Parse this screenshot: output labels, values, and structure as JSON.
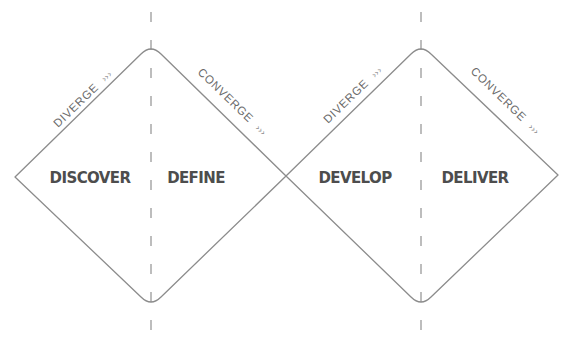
{
  "diagram": {
    "colors": {
      "outline": "#8c8c8c",
      "divider": "#9a9a9a",
      "phase_text": "#4d4d4d",
      "slope_text": "#6a6a6a"
    },
    "diamonds": [
      {
        "slopes": {
          "up": {
            "label": "DIVERGE",
            "arrow": "›››"
          },
          "down": {
            "label": "CONVERGE",
            "arrow": "›››"
          }
        },
        "phases": [
          {
            "label": "DISCOVER"
          },
          {
            "label": "DEFINE"
          }
        ]
      },
      {
        "slopes": {
          "up": {
            "label": "DIVERGE",
            "arrow": "›››"
          },
          "down": {
            "label": "CONVERGE",
            "arrow": "›››"
          }
        },
        "phases": [
          {
            "label": "DEVELOP"
          },
          {
            "label": "DELIVER"
          }
        ]
      }
    ]
  }
}
